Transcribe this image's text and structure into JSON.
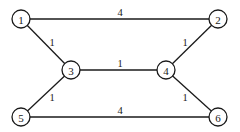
{
  "graph": {
    "type": "weighted-undirected",
    "node_radius": 9,
    "colors": {
      "stroke": "#1a1a1a",
      "fill": "#ffffff",
      "text": "#1a1a1a"
    },
    "nodes": [
      {
        "id": "1",
        "label": "1",
        "x": 21,
        "y": 19
      },
      {
        "id": "2",
        "label": "2",
        "x": 218,
        "y": 19
      },
      {
        "id": "3",
        "label": "3",
        "x": 71,
        "y": 70
      },
      {
        "id": "4",
        "label": "4",
        "x": 166,
        "y": 70
      },
      {
        "id": "5",
        "label": "5",
        "x": 21,
        "y": 117
      },
      {
        "id": "6",
        "label": "6",
        "x": 218,
        "y": 117
      }
    ],
    "edges": [
      {
        "from": "1",
        "to": "2",
        "weight": "4",
        "label_x": 120,
        "label_y": 12
      },
      {
        "from": "1",
        "to": "3",
        "weight": "1",
        "label_x": 52,
        "label_y": 42
      },
      {
        "from": "2",
        "to": "4",
        "weight": "1",
        "label_x": 185,
        "label_y": 42
      },
      {
        "from": "3",
        "to": "4",
        "weight": "1",
        "label_x": 120,
        "label_y": 63
      },
      {
        "from": "3",
        "to": "5",
        "weight": "1",
        "label_x": 52,
        "label_y": 97
      },
      {
        "from": "4",
        "to": "6",
        "weight": "1",
        "label_x": 185,
        "label_y": 97
      },
      {
        "from": "5",
        "to": "6",
        "weight": "4",
        "label_x": 120,
        "label_y": 110
      }
    ]
  }
}
